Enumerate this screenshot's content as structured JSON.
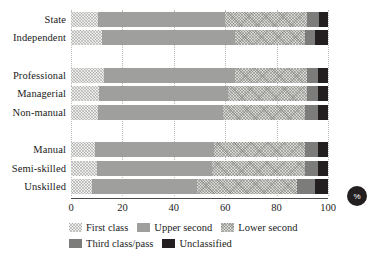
{
  "chart_data": {
    "type": "bar",
    "orientation": "horizontal",
    "stacked": true,
    "normalized": true,
    "title": "",
    "subtitle": "",
    "xlabel": "%",
    "ylabel": "",
    "xlim": [
      0,
      100
    ],
    "xticks": [
      "0",
      "20",
      "40",
      "60",
      "80",
      "100"
    ],
    "xtick_values": [
      0,
      20,
      40,
      60,
      80,
      100
    ],
    "grid": true,
    "grid_axis": "x",
    "legend_position": "bottom",
    "categories": [
      "State",
      "Independent",
      "",
      "Professional",
      "Managerial",
      "Non-manual",
      "",
      "Manual",
      "Semi-skilled",
      "Unskilled"
    ],
    "group_gaps_after": [
      "Independent",
      "Non-manual"
    ],
    "series": [
      {
        "name": "First class",
        "color": "#eeeeec",
        "pattern": "light-dotted",
        "values": [
          10.5,
          12.0,
          null,
          13.0,
          11.0,
          10.5,
          null,
          9.5,
          10.0,
          8.0
        ]
      },
      {
        "name": "Upper second",
        "color": "#9f9f9e",
        "pattern": "solid",
        "values": [
          49.5,
          52.0,
          null,
          51.0,
          50.0,
          48.5,
          null,
          46.0,
          45.0,
          41.0
        ]
      },
      {
        "name": "Lower second",
        "color": "#d7d7d3",
        "pattern": "checker",
        "values": [
          32.0,
          27.0,
          null,
          28.0,
          31.0,
          32.0,
          null,
          35.5,
          36.0,
          39.0
        ]
      },
      {
        "name": "Third class/pass",
        "color": "#7c7c7b",
        "pattern": "solid",
        "values": [
          4.5,
          4.0,
          null,
          4.0,
          4.0,
          5.0,
          null,
          5.0,
          5.0,
          7.0
        ]
      },
      {
        "name": "Unclassified",
        "color": "#231f20",
        "pattern": "solid",
        "values": [
          3.5,
          5.0,
          null,
          4.0,
          4.0,
          4.0,
          null,
          4.0,
          4.0,
          5.0
        ]
      }
    ],
    "annotations": [
      {
        "name": "percent-badge",
        "text": "%"
      }
    ]
  },
  "axis": {
    "x_ticks": [
      {
        "label": "0",
        "value": 0
      },
      {
        "label": "20",
        "value": 20
      },
      {
        "label": "40",
        "value": 40
      },
      {
        "label": "60",
        "value": 60
      },
      {
        "label": "80",
        "value": 80
      },
      {
        "label": "100",
        "value": 100
      }
    ]
  },
  "legend": {
    "row1": [
      {
        "label": "First class",
        "key": "first"
      },
      {
        "label": "Upper second",
        "key": "upper"
      },
      {
        "label": "Lower second",
        "key": "lower"
      }
    ],
    "row2": [
      {
        "label": "Third class/pass",
        "key": "third"
      },
      {
        "label": "Unclassified",
        "key": "unclass"
      }
    ]
  },
  "badge": {
    "text": "%"
  }
}
